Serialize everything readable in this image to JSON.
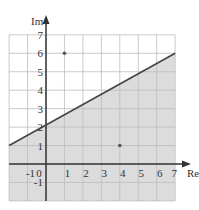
{
  "chart_data": {
    "type": "line",
    "title": "",
    "xlabel": "Re",
    "ylabel": "Im",
    "xlim": [
      -2,
      7
    ],
    "ylim": [
      -2,
      7
    ],
    "grid": true,
    "x_ticks": [
      "-1",
      "0",
      "1",
      "2",
      "3",
      "4",
      "5",
      "6",
      "7"
    ],
    "y_ticks": [
      "-1",
      "1",
      "2",
      "3",
      "4",
      "5",
      "6",
      "7"
    ],
    "line": {
      "x": [
        -2,
        7
      ],
      "y": [
        1,
        6
      ],
      "equation": "y = (5/9)x + 19/9"
    },
    "shaded_region": "below line",
    "points": [
      {
        "x": 1,
        "y": 6
      },
      {
        "x": 4,
        "y": 1
      }
    ]
  },
  "colors": {
    "shade": "#dcdcdc",
    "grid": "#bdbdbd",
    "axis": "#333333",
    "line": "#444444",
    "point": "#555555"
  }
}
